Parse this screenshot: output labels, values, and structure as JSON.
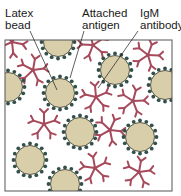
{
  "labels": {
    "latex_bead_line1": "Latex",
    "latex_bead_line2": "bead",
    "antigen_line1": "Attached",
    "antigen_line2": "antigen",
    "igm_line1": "IgM",
    "igm_line2": "antibody"
  },
  "colors": {
    "bead_fill": "#d8ceaa",
    "bead_stroke": "#3a3a2a",
    "antigen_dot": "#34504a",
    "antibody": "#a64a5c",
    "frame": "#555555"
  }
}
